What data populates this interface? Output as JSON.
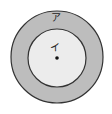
{
  "diagram": {
    "type": "concentric-circles",
    "outer_region": {
      "label": "ア",
      "fill": "#bdbdbd",
      "stroke": "#333333"
    },
    "inner_region": {
      "label": "イ",
      "fill": "#ececec",
      "stroke": "#333333"
    },
    "center_point": {
      "fill": "#111111"
    },
    "background": "#ffffff"
  }
}
